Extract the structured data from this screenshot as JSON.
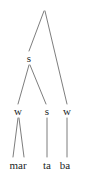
{
  "figure": {
    "type": "metrical-tree",
    "width": 87,
    "height": 174,
    "background_color": "#ffffff",
    "line_color": "#6e6e6e",
    "text_color": "#221f1f"
  },
  "nodes": [
    {
      "id": "root",
      "label": "",
      "x": 44,
      "y": 10,
      "level": 0
    },
    {
      "id": "n-s1",
      "label": "s",
      "x": 29,
      "y": 58,
      "level": 1
    },
    {
      "id": "n-w1",
      "label": "w",
      "x": 18,
      "y": 111,
      "level": 2
    },
    {
      "id": "n-s2",
      "label": "s",
      "x": 47,
      "y": 111,
      "level": 2
    },
    {
      "id": "n-w2",
      "label": "w",
      "x": 67,
      "y": 111,
      "level": 2
    },
    {
      "id": "leaf-mar",
      "label": "mar",
      "x": 18,
      "y": 165,
      "level": 3
    },
    {
      "id": "leaf-ta",
      "label": "ta",
      "x": 47,
      "y": 165,
      "level": 3
    },
    {
      "id": "leaf-ba",
      "label": "ba",
      "x": 65,
      "y": 165,
      "level": 3
    }
  ],
  "edges": [
    {
      "id": "edge-root-s1",
      "from": "root",
      "to": "n-s1",
      "x1": 44,
      "y1": 11,
      "x2": 29,
      "y2": 51
    },
    {
      "id": "edge-root-w2",
      "from": "root",
      "to": "n-w2",
      "x1": 45,
      "y1": 11,
      "x2": 67,
      "y2": 104
    },
    {
      "id": "edge-s1-w1",
      "from": "n-s1",
      "to": "n-w1",
      "x1": 29,
      "y1": 65,
      "x2": 18,
      "y2": 104
    },
    {
      "id": "edge-s1-s2",
      "from": "n-s1",
      "to": "n-s2",
      "x1": 30,
      "y1": 65,
      "x2": 46,
      "y2": 104
    },
    {
      "id": "edge-w1-mar-a",
      "from": "n-w1",
      "to": "leaf-mar",
      "x1": 18,
      "y1": 118,
      "x2": 13,
      "y2": 157
    },
    {
      "id": "edge-w1-mar-b",
      "from": "n-w1",
      "to": "leaf-mar",
      "x1": 19,
      "y1": 118,
      "x2": 24,
      "y2": 157
    },
    {
      "id": "edge-s2-ta",
      "from": "n-s2",
      "to": "leaf-ta",
      "x1": 47,
      "y1": 118,
      "x2": 47,
      "y2": 157
    },
    {
      "id": "edge-w2-ba",
      "from": "n-w2",
      "to": "leaf-ba",
      "x1": 67,
      "y1": 118,
      "x2": 67,
      "y2": 157
    }
  ]
}
